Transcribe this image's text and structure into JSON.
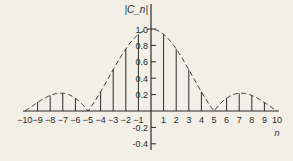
{
  "chart_data": {
    "type": "stem",
    "title": "",
    "ylabel": "|C_n|",
    "xlabel": "n",
    "x": [
      -10,
      -9,
      -8,
      -7,
      -6,
      -5,
      -4,
      -3,
      -2,
      -1,
      0,
      1,
      2,
      3,
      4,
      5,
      6,
      7,
      8,
      9,
      10
    ],
    "values": [
      0.0,
      0.109,
      0.189,
      0.216,
      0.156,
      0.0,
      0.234,
      0.505,
      0.757,
      0.935,
      1.0,
      0.935,
      0.757,
      0.505,
      0.234,
      0.0,
      0.156,
      0.216,
      0.189,
      0.109,
      0.0
    ],
    "envelope": "dashed |sinc(n/5)| curve",
    "xticks": [
      "-10",
      "-9",
      "-8",
      "-7",
      "-6",
      "-5",
      "-4",
      "-3",
      "-2",
      "-1",
      "1",
      "2",
      "3",
      "4",
      "5",
      "6",
      "7",
      "8",
      "9",
      "10"
    ],
    "yticks": [
      "1.0",
      "0.8",
      "0.6",
      "0.4",
      "0.2",
      "-0.2",
      "-0.4"
    ],
    "xlim": [
      -10,
      10
    ],
    "ylim": [
      -0.4,
      1.0
    ],
    "grid": false,
    "legend": null
  },
  "colors": {
    "background": "#f1efe6",
    "ink": "#2a2a2a"
  }
}
